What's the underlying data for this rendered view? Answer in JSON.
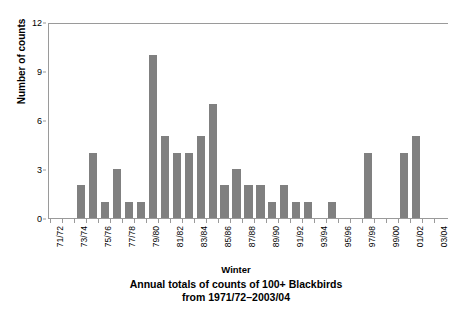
{
  "chart_data": {
    "type": "bar",
    "title": "",
    "caption_line1": "Annual totals of counts of 100+ Blackbirds",
    "caption_line2": "from 1971/72–2003/04",
    "xlabel": "Winter",
    "ylabel": "Number of counts",
    "ylim": [
      0,
      12
    ],
    "yticks": [
      0,
      3,
      6,
      9,
      12
    ],
    "ytick_labels": [
      "0",
      "3",
      "6",
      "9",
      "12"
    ],
    "grid": false,
    "legend": "none",
    "bar_color": "#808080",
    "axis_color": "#9a9a9a",
    "categories": [
      "71/72",
      "72/73",
      "73/74",
      "74/75",
      "75/76",
      "76/77",
      "77/78",
      "78/79",
      "79/80",
      "80/81",
      "81/82",
      "82/83",
      "83/84",
      "84/85",
      "85/86",
      "86/87",
      "87/88",
      "88/89",
      "89/90",
      "90/91",
      "91/92",
      "92/93",
      "93/94",
      "94/95",
      "95/96",
      "96/97",
      "97/98",
      "98/99",
      "99/00",
      "00/01",
      "01/02",
      "02/03",
      "03/04"
    ],
    "tick_labels": [
      "71/72",
      "",
      "73/74",
      "",
      "75/76",
      "",
      "77/78",
      "",
      "79/80",
      "",
      "81/82",
      "",
      "83/84",
      "",
      "85/86",
      "",
      "87/88",
      "",
      "89/90",
      "",
      "91/92",
      "",
      "93/94",
      "",
      "95/96",
      "",
      "97/98",
      "",
      "99/00",
      "",
      "01/02",
      "",
      "03/04"
    ],
    "values": [
      0,
      0,
      2,
      4,
      1,
      3,
      1,
      1,
      10,
      5,
      4,
      4,
      5,
      7,
      2,
      3,
      2,
      2,
      1,
      2,
      1,
      1,
      0,
      1,
      0,
      0,
      4,
      0,
      0,
      4,
      5,
      0,
      0
    ]
  }
}
